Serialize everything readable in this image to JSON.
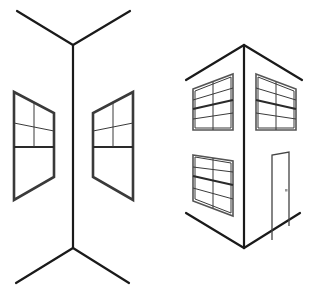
{
  "figure": {
    "description": "Two-point perspective line drawings: an interior corner (left) and an exterior building corner (right)",
    "colors": {
      "background": "#ffffff",
      "line": "#1a1a1a",
      "window_frame": "#3a3a3a",
      "door_knob": "#9a9a9a"
    },
    "panels": [
      {
        "name": "interior-corner",
        "elements": [
          "ceiling-corner-lines",
          "vertical-corner-edge",
          "floor-corner-lines",
          "left-wall-window",
          "right-wall-window"
        ]
      },
      {
        "name": "exterior-corner",
        "elements": [
          "roof-edge-lines",
          "vertical-corner-edge",
          "ground-edge-lines",
          "upper-left-window",
          "upper-right-window",
          "lower-left-window",
          "door"
        ]
      }
    ]
  }
}
